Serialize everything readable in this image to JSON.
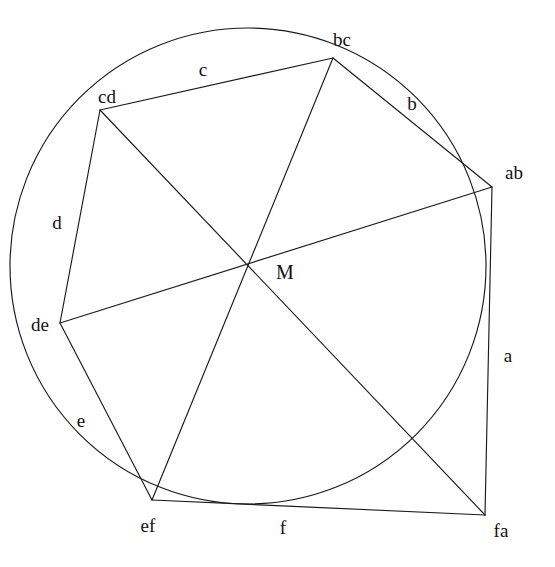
{
  "figure": {
    "background_color": "#ffffff",
    "stroke_color": "#1a1a1a",
    "width": 555,
    "height": 567
  },
  "incircle": {
    "center_label": "M",
    "center": {
      "x": 248,
      "y": 266
    },
    "radius": 238
  },
  "vertices": [
    {
      "id": "ab",
      "label": "ab",
      "x": 492,
      "y": 187,
      "label_x": 514,
      "label_y": 172
    },
    {
      "id": "bc",
      "label": "bc",
      "x": 333,
      "y": 58,
      "label_x": 342,
      "label_y": 39
    },
    {
      "id": "cd",
      "label": "cd",
      "x": 100,
      "y": 110,
      "label_x": 107,
      "label_y": 96
    },
    {
      "id": "de",
      "label": "de",
      "x": 60,
      "y": 323,
      "label_x": 40,
      "label_y": 324
    },
    {
      "id": "ef",
      "label": "ef",
      "x": 152,
      "y": 500,
      "label_x": 148,
      "label_y": 525
    },
    {
      "id": "fa",
      "label": "fa",
      "x": 485,
      "y": 515,
      "label_x": 501,
      "label_y": 530
    }
  ],
  "tangent_points": [
    {
      "id": "a",
      "label": "a",
      "x": 485,
      "y": 352,
      "label_x": 508,
      "label_y": 355
    },
    {
      "id": "b",
      "label": "b",
      "x": 430,
      "y": 117,
      "label_x": 412,
      "label_y": 103
    },
    {
      "id": "c",
      "label": "c",
      "x": 213,
      "y": 79,
      "label_x": 203,
      "label_y": 69
    },
    {
      "id": "d",
      "label": "d",
      "x": 78,
      "y": 228,
      "label_x": 57,
      "label_y": 222
    },
    {
      "id": "e",
      "label": "e",
      "x": 100,
      "y": 430,
      "label_x": 81,
      "label_y": 420
    },
    {
      "id": "f",
      "label": "f",
      "x": 283,
      "y": 503,
      "label_x": 283,
      "label_y": 527
    }
  ],
  "hexagon_sides": [
    {
      "id": "side-a",
      "from": "fa",
      "to": "ab",
      "tangent_point": "a"
    },
    {
      "id": "side-b",
      "from": "ab",
      "to": "bc",
      "tangent_point": "b"
    },
    {
      "id": "side-c",
      "from": "bc",
      "to": "cd",
      "tangent_point": "c"
    },
    {
      "id": "side-d",
      "from": "cd",
      "to": "de",
      "tangent_point": "d"
    },
    {
      "id": "side-e",
      "from": "de",
      "to": "ef",
      "tangent_point": "e"
    },
    {
      "id": "side-f",
      "from": "ef",
      "to": "fa",
      "tangent_point": "f"
    }
  ],
  "diagonals": [
    {
      "id": "diagonal-ab-de",
      "from": "ab",
      "to": "de",
      "through": "M"
    },
    {
      "id": "diagonal-bc-ef",
      "from": "bc",
      "to": "ef",
      "through": "M"
    },
    {
      "id": "diagonal-cd-fa",
      "from": "cd",
      "to": "fa",
      "through": "M"
    }
  ],
  "center_label_position": {
    "x": 285,
    "y": 272
  }
}
